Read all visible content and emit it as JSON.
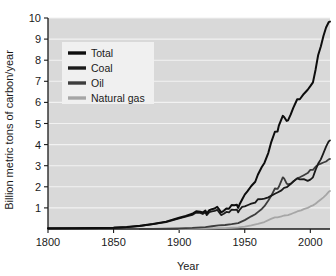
{
  "chart_data": {
    "type": "line",
    "title": "",
    "xlabel": "Year",
    "ylabel": "Billion metric tons of carbon/year",
    "xlim": [
      1800,
      2015
    ],
    "ylim": [
      0,
      10
    ],
    "xticks": [
      1800,
      1850,
      1900,
      1950,
      2000
    ],
    "yticks": [
      1,
      2,
      3,
      4,
      5,
      6,
      7,
      8,
      9,
      10
    ],
    "grid": "horizontal",
    "legend_position": "upper-left-inside",
    "plot_background": "#d9d9d9",
    "gridline_color": "#f2f2f2",
    "series": [
      {
        "name": "Total",
        "color": "#0d0d0d",
        "x": [
          1800,
          1820,
          1840,
          1850,
          1860,
          1870,
          1880,
          1890,
          1900,
          1905,
          1910,
          1913,
          1916,
          1918,
          1920,
          1921,
          1923,
          1925,
          1927,
          1929,
          1930,
          1932,
          1934,
          1936,
          1938,
          1940,
          1942,
          1944,
          1945,
          1946,
          1948,
          1950,
          1952,
          1955,
          1958,
          1960,
          1963,
          1965,
          1968,
          1970,
          1973,
          1975,
          1976,
          1979,
          1980,
          1982,
          1983,
          1985,
          1987,
          1990,
          1992,
          1995,
          1998,
          2000,
          2002,
          2004,
          2006,
          2008,
          2010,
          2012,
          2014,
          2015
        ],
        "y": [
          0.03,
          0.04,
          0.05,
          0.06,
          0.09,
          0.15,
          0.24,
          0.35,
          0.53,
          0.62,
          0.72,
          0.84,
          0.82,
          0.78,
          0.87,
          0.74,
          0.89,
          0.94,
          0.97,
          1.05,
          0.97,
          0.79,
          0.86,
          0.97,
          0.96,
          1.14,
          1.13,
          1.15,
          1.0,
          1.16,
          1.4,
          1.63,
          1.78,
          2.04,
          2.24,
          2.57,
          2.94,
          3.13,
          3.61,
          4.08,
          4.61,
          4.62,
          4.9,
          5.36,
          5.31,
          5.12,
          5.15,
          5.42,
          5.74,
          6.15,
          6.15,
          6.4,
          6.6,
          6.77,
          6.95,
          7.55,
          8.25,
          8.65,
          9.15,
          9.55,
          9.8,
          9.83
        ]
      },
      {
        "name": "Coal",
        "color": "#1a1a1a",
        "x": [
          1800,
          1820,
          1840,
          1850,
          1860,
          1870,
          1880,
          1890,
          1900,
          1905,
          1910,
          1913,
          1916,
          1918,
          1920,
          1921,
          1923,
          1925,
          1927,
          1929,
          1930,
          1932,
          1934,
          1936,
          1938,
          1940,
          1942,
          1944,
          1945,
          1946,
          1948,
          1950,
          1953,
          1955,
          1958,
          1960,
          1963,
          1965,
          1968,
          1970,
          1973,
          1975,
          1978,
          1980,
          1982,
          1985,
          1987,
          1990,
          1992,
          1995,
          1998,
          2000,
          2002,
          2004,
          2006,
          2008,
          2010,
          2012,
          2014,
          2015
        ],
        "y": [
          0.03,
          0.04,
          0.05,
          0.06,
          0.09,
          0.14,
          0.23,
          0.33,
          0.5,
          0.59,
          0.67,
          0.78,
          0.76,
          0.71,
          0.79,
          0.66,
          0.8,
          0.83,
          0.86,
          0.91,
          0.83,
          0.66,
          0.72,
          0.81,
          0.79,
          0.92,
          0.91,
          0.92,
          0.79,
          0.9,
          1.05,
          1.07,
          1.15,
          1.2,
          1.25,
          1.41,
          1.42,
          1.44,
          1.5,
          1.57,
          1.67,
          1.73,
          1.83,
          1.95,
          1.98,
          2.13,
          2.25,
          2.4,
          2.35,
          2.36,
          2.28,
          2.34,
          2.45,
          2.8,
          3.1,
          3.3,
          3.6,
          3.9,
          4.15,
          4.2
        ]
      },
      {
        "name": "Oil",
        "color": "#3d3d3d",
        "x": [
          1870,
          1880,
          1890,
          1900,
          1910,
          1920,
          1925,
          1930,
          1935,
          1940,
          1945,
          1950,
          1955,
          1958,
          1960,
          1963,
          1965,
          1968,
          1970,
          1973,
          1975,
          1976,
          1979,
          1980,
          1982,
          1983,
          1985,
          1987,
          1990,
          1992,
          1995,
          1998,
          2000,
          2002,
          2004,
          2006,
          2008,
          2010,
          2012,
          2014,
          2015
        ],
        "y": [
          0.005,
          0.01,
          0.02,
          0.03,
          0.05,
          0.09,
          0.13,
          0.17,
          0.19,
          0.23,
          0.28,
          0.42,
          0.6,
          0.7,
          0.8,
          0.95,
          1.08,
          1.35,
          1.55,
          1.92,
          1.9,
          2.0,
          2.45,
          2.4,
          2.15,
          2.12,
          2.15,
          2.25,
          2.4,
          2.45,
          2.55,
          2.65,
          2.8,
          2.8,
          2.95,
          3.05,
          3.1,
          3.15,
          3.2,
          3.3,
          3.32
        ]
      },
      {
        "name": "Natural gas",
        "color": "#a6a6a6",
        "x": [
          1900,
          1910,
          1920,
          1930,
          1935,
          1940,
          1945,
          1950,
          1955,
          1960,
          1965,
          1970,
          1973,
          1975,
          1978,
          1980,
          1983,
          1985,
          1988,
          1990,
          1993,
          1995,
          1998,
          2000,
          2002,
          2004,
          2006,
          2008,
          2010,
          2012,
          2014,
          2015
        ],
        "y": [
          0.005,
          0.01,
          0.02,
          0.04,
          0.04,
          0.06,
          0.08,
          0.11,
          0.17,
          0.24,
          0.33,
          0.48,
          0.55,
          0.55,
          0.6,
          0.64,
          0.66,
          0.7,
          0.78,
          0.83,
          0.88,
          0.94,
          1.0,
          1.07,
          1.12,
          1.2,
          1.3,
          1.4,
          1.5,
          1.62,
          1.76,
          1.8
        ]
      }
    ],
    "legend": [
      {
        "label": "Total",
        "color": "#0d0d0d"
      },
      {
        "label": "Coal",
        "color": "#1a1a1a"
      },
      {
        "label": "Oil",
        "color": "#3d3d3d"
      },
      {
        "label": "Natural gas",
        "color": "#a6a6a6"
      }
    ]
  }
}
